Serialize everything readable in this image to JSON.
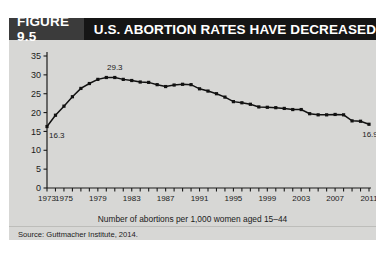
{
  "figure": {
    "number_label": "FIGURE 9.5",
    "title": "U.S. ABORTION RATES HAVE DECREASED",
    "source": "Source: Guttmacher Institute, 2014.",
    "bar_bg": "#151515",
    "numblock_bg": "#3b3b3b",
    "panel_bg": "#d7d7d5"
  },
  "chart_data": {
    "type": "line",
    "title": "U.S. ABORTION RATES HAVE DECREASED",
    "xlabel": "Number of abortions per 1,000 women aged 15–44",
    "ylabel": "",
    "xlim": [
      1973,
      2011
    ],
    "ylim": [
      0,
      35
    ],
    "yticks": [
      0,
      5,
      10,
      15,
      20,
      25,
      30,
      35
    ],
    "ytick_labels": [
      "0",
      "5",
      "10",
      "15",
      "20",
      "25",
      "30",
      "35"
    ],
    "xticks": [
      1973,
      1974,
      1975,
      1976,
      1977,
      1978,
      1979,
      1980,
      1981,
      1982,
      1983,
      1984,
      1985,
      1986,
      1987,
      1988,
      1989,
      1990,
      1991,
      1992,
      1993,
      1994,
      1995,
      1996,
      1997,
      1998,
      1999,
      2000,
      2001,
      2002,
      2003,
      2004,
      2005,
      2006,
      2007,
      2008,
      2009,
      2010,
      2011
    ],
    "xtick_labels": [
      "1973",
      "1975",
      "1979",
      "1983",
      "1987",
      "1991",
      "1995",
      "1999",
      "2003",
      "2007",
      "2011"
    ],
    "xtick_label_years": [
      1973,
      1975,
      1979,
      1983,
      1987,
      1991,
      1995,
      1999,
      2003,
      2007,
      2011
    ],
    "grid": false,
    "legend": false,
    "marker": "square",
    "line_color": "#111111",
    "marker_color": "#111111",
    "x": [
      1973,
      1974,
      1975,
      1976,
      1977,
      1978,
      1979,
      1980,
      1981,
      1982,
      1983,
      1984,
      1985,
      1986,
      1987,
      1988,
      1989,
      1990,
      1991,
      1992,
      1993,
      1994,
      1995,
      1996,
      1997,
      1998,
      1999,
      2000,
      2001,
      2002,
      2003,
      2004,
      2005,
      2006,
      2007,
      2008,
      2009,
      2010,
      2011
    ],
    "values": [
      16.3,
      19.3,
      21.7,
      24.2,
      26.4,
      27.7,
      28.8,
      29.3,
      29.3,
      28.8,
      28.5,
      28.1,
      28.0,
      27.4,
      26.9,
      27.3,
      27.5,
      27.4,
      26.3,
      25.7,
      25.0,
      24.1,
      22.9,
      22.6,
      22.2,
      21.5,
      21.4,
      21.3,
      21.1,
      20.8,
      20.8,
      19.7,
      19.4,
      19.4,
      19.5,
      19.4,
      17.8,
      17.7,
      16.9
    ],
    "annotations": [
      {
        "label": "16.3",
        "x": 1973,
        "y": 16.3,
        "position": "below-right"
      },
      {
        "label": "29.3",
        "x": 1981,
        "y": 29.3,
        "position": "above"
      },
      {
        "label": "16.9",
        "x": 2011,
        "y": 16.9,
        "position": "below-left"
      }
    ]
  }
}
